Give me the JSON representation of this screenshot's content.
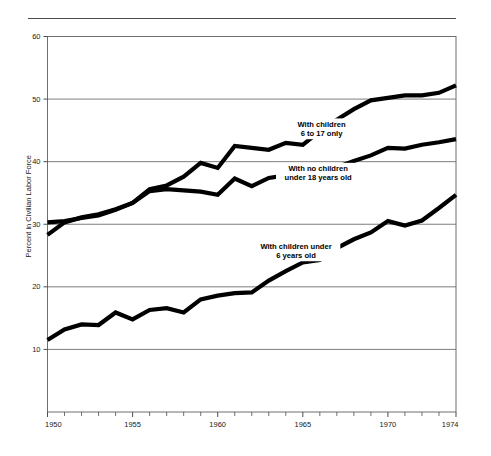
{
  "figure": {
    "top_rule": true,
    "background_color": "#ffffff",
    "line_color": "#000000",
    "grid_color": "#6e6e6e",
    "frame_color": "#6e6e6e"
  },
  "chart_data": {
    "type": "line",
    "title": "",
    "subtitle": "",
    "xlabel": "",
    "ylabel": "Percent in Civilian Labor Force",
    "xlim": [
      1950,
      1974
    ],
    "ylim": [
      0,
      60
    ],
    "grid": true,
    "grid_axis": "y",
    "legend_position": "inline-annotations",
    "x_tick_labels": [
      "1950",
      "1955",
      "1960",
      "1965",
      "1970",
      "1974"
    ],
    "x_tick_values": [
      1950,
      1955,
      1960,
      1965,
      1970,
      1974
    ],
    "x_minor_ticks": [
      1951,
      1952,
      1953,
      1954,
      1956,
      1957,
      1958,
      1959,
      1961,
      1962,
      1963,
      1964,
      1966,
      1967,
      1968,
      1969,
      1971,
      1972,
      1973
    ],
    "y_tick_labels": [
      "10",
      "20",
      "30",
      "40",
      "50",
      "60"
    ],
    "y_tick_values": [
      10,
      20,
      30,
      40,
      50,
      60
    ],
    "x": [
      1950,
      1951,
      1952,
      1953,
      1954,
      1955,
      1956,
      1957,
      1958,
      1959,
      1960,
      1961,
      1962,
      1963,
      1964,
      1965,
      1966,
      1967,
      1968,
      1969,
      1970,
      1971,
      1972,
      1973,
      1974
    ],
    "series": [
      {
        "name": "With children 6 to 17 only",
        "label_lines": [
          "With children",
          "6 to 17 only"
        ],
        "label_x": 1966.1,
        "label_y": 45.6,
        "values": [
          28.3,
          30.3,
          31.1,
          31.6,
          32.4,
          33.4,
          35.6,
          36.2,
          37.6,
          39.8,
          39.0,
          42.5,
          42.2,
          41.9,
          43.0,
          42.7,
          44.9,
          46.7,
          48.4,
          49.8,
          50.2,
          50.6,
          50.6,
          51.0,
          52.2
        ]
      },
      {
        "name": "With no children under 18 years old",
        "label_lines": [
          "With no children",
          "under 18 years old"
        ],
        "label_x": 1965.9,
        "label_y": 38.5,
        "values": [
          30.3,
          30.5,
          31.0,
          31.4,
          32.3,
          33.4,
          35.3,
          35.6,
          35.4,
          35.2,
          34.7,
          37.3,
          36.1,
          37.4,
          37.8,
          38.3,
          38.6,
          39.1,
          40.1,
          41.0,
          42.2,
          42.1,
          42.7,
          43.1,
          43.6
        ]
      },
      {
        "name": "With children under 6 years old",
        "label_lines": [
          "With children under",
          "6 years old"
        ],
        "label_x": 1964.6,
        "label_y": 26.1,
        "values": [
          11.5,
          13.2,
          14.0,
          13.9,
          15.9,
          14.8,
          16.3,
          16.6,
          15.9,
          18.0,
          18.6,
          19.0,
          19.1,
          21.0,
          22.5,
          23.9,
          24.3,
          26.2,
          27.6,
          28.7,
          30.5,
          29.8,
          30.6,
          32.6,
          34.7
        ]
      }
    ]
  },
  "axes": {
    "y_axis_title": "Percent in Civilian Labor Force"
  }
}
